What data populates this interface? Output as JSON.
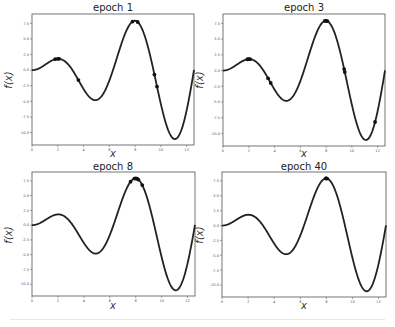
{
  "chart_data": [
    {
      "type": "line",
      "title": "epoch 1",
      "xlabel": "x",
      "ylabel": "f(x)",
      "function": "x*sin(x)",
      "xlim": [
        0,
        12.57
      ],
      "ylim": [
        -12,
        9
      ],
      "xticks": [
        "0",
        "2",
        "4",
        "6",
        "8",
        "10",
        "12"
      ],
      "yticks": [
        "7.5",
        "5.0",
        "2.5",
        "0.0",
        "-2.5",
        "-5.0",
        "-7.5",
        "-10.0"
      ],
      "samples_x": [
        1.8,
        2.0,
        2.1,
        3.6,
        7.8,
        8.2,
        9.5,
        9.7
      ]
    },
    {
      "type": "line",
      "title": "epoch 3",
      "xlabel": "x",
      "ylabel": "f(x)",
      "function": "x*sin(x)",
      "xlim": [
        0,
        12.57
      ],
      "ylim": [
        -12,
        9
      ],
      "xticks": [
        "0",
        "2",
        "4",
        "6",
        "8",
        "10",
        "12"
      ],
      "yticks": [
        "7.5",
        "5.0",
        "2.5",
        "0.0",
        "-2.5",
        "-5.0",
        "-7.5",
        "-10.0"
      ],
      "samples_x": [
        1.9,
        2.0,
        2.1,
        3.5,
        3.7,
        7.9,
        8.0,
        8.1,
        9.4,
        9.45,
        11.8
      ]
    },
    {
      "type": "line",
      "title": "epoch 8",
      "xlabel": "x",
      "ylabel": "f(x)",
      "function": "x*sin(x)",
      "xlim": [
        0,
        12.57
      ],
      "ylim": [
        -12,
        9
      ],
      "xticks": [
        "0",
        "2",
        "4",
        "6",
        "8",
        "10",
        "12"
      ],
      "yticks": [
        "7.5",
        "5.0",
        "2.5",
        "0.0",
        "-2.5",
        "-5.0",
        "-7.5",
        "-10.0"
      ],
      "samples_x": [
        7.6,
        7.9,
        8.0,
        8.1,
        8.2,
        8.5
      ]
    },
    {
      "type": "line",
      "title": "epoch 40",
      "xlabel": "x",
      "ylabel": "f(x)",
      "function": "x*sin(x)",
      "xlim": [
        0,
        12.57
      ],
      "ylim": [
        -12,
        9
      ],
      "xticks": [
        "0",
        "2",
        "4",
        "6",
        "8",
        "10",
        "12"
      ],
      "yticks": [
        "7.5",
        "5.0",
        "2.5",
        "0.0",
        "-2.5",
        "-5.0",
        "-7.5",
        "-10.0"
      ],
      "samples_x": [
        7.95,
        8.0,
        8.05
      ]
    }
  ],
  "panels": [
    {
      "title": "epoch 1",
      "xlabel": "x",
      "ylabel": "f(x)"
    },
    {
      "title": "epoch 3",
      "xlabel": "x",
      "ylabel": "f(x)"
    },
    {
      "title": "epoch 8",
      "xlabel": "x",
      "ylabel": "f(x)"
    },
    {
      "title": "epoch 40",
      "xlabel": "x",
      "ylabel": "f(x)"
    }
  ]
}
